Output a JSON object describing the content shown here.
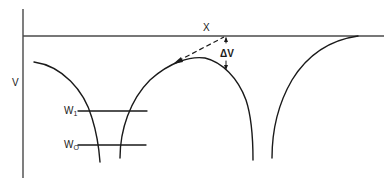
{
  "diagram": {
    "type": "potential-energy-diagram",
    "axis_labels": {
      "vertical": "V",
      "horizontal": "X"
    },
    "annotations": {
      "delta_v": "ΔV",
      "delta_symbol": "Δ",
      "delta_var": "V"
    },
    "energy_levels": [
      {
        "label": "W",
        "subscript": "1",
        "name": "W1"
      },
      {
        "label": "W",
        "subscript": "O",
        "name": "W0"
      }
    ],
    "colors": {
      "line": "#1a1a1a",
      "axis": "#3a3a3a",
      "background": "#ffffff"
    }
  }
}
